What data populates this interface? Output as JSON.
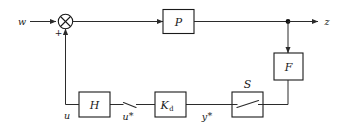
{
  "diagram": {
    "blocks": [
      {
        "id": "plant",
        "label": "P",
        "sub": "",
        "name": "block-p"
      },
      {
        "id": "filter",
        "label": "F",
        "sub": "",
        "name": "block-f"
      },
      {
        "id": "hold",
        "label": "H",
        "sub": "",
        "name": "block-h"
      },
      {
        "id": "controller",
        "label": "K",
        "sub": "d",
        "name": "block-kd"
      },
      {
        "id": "sampler",
        "label": "S",
        "sub": "",
        "name": "block-s"
      }
    ],
    "signals": [
      {
        "id": "w",
        "label": "w",
        "star": "",
        "name": "signal-label-w"
      },
      {
        "id": "z",
        "label": "z",
        "star": "",
        "name": "signal-label-z"
      },
      {
        "id": "u",
        "label": "u",
        "star": "",
        "name": "signal-label-u"
      },
      {
        "id": "u_star",
        "label": "u",
        "star": "*",
        "name": "signal-label-u-star"
      },
      {
        "id": "y_star",
        "label": "y",
        "star": "*",
        "name": "signal-label-y-star"
      }
    ],
    "summing_junction": {
      "name": "summing-junction",
      "sign_top": "",
      "sign_bottom": "+",
      "glyph": "cross-circle"
    },
    "branch_node": {
      "name": "branch-node-z",
      "glyph": "junction-dot"
    },
    "samplers": [
      {
        "id": "sampler-open-u-star",
        "name": "switch-symbol-u-star",
        "boxed": false
      },
      {
        "id": "sampler-boxed-s",
        "name": "switch-symbol-s",
        "boxed": true
      }
    ],
    "colors": {
      "background": "#ffffff",
      "stroke": "#1a1a1a",
      "wire": "#4a4a4a",
      "text": "#1a1a1a"
    }
  }
}
